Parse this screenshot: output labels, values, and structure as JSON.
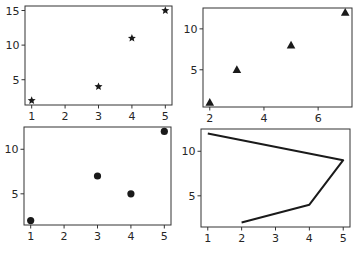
{
  "figure": {
    "layout": "2x2 subplots",
    "background": "#ffffff",
    "ink": "#1a1a1a"
  },
  "chart_data": [
    {
      "type": "scatter",
      "position": "top-left",
      "marker": "star",
      "x": [
        1,
        3,
        4,
        5
      ],
      "y": [
        2,
        4,
        11,
        15
      ],
      "title": "",
      "xlabel": "",
      "ylabel": "",
      "xticks": [
        1,
        2,
        3,
        4,
        5
      ],
      "yticks": [
        5,
        10,
        15
      ],
      "xlim": [
        0.8,
        5.2
      ],
      "ylim": [
        1.35,
        15.65
      ],
      "grid": false
    },
    {
      "type": "scatter",
      "position": "top-right",
      "marker": "triangle",
      "x": [
        2,
        3,
        5,
        7
      ],
      "y": [
        1,
        5,
        8,
        12
      ],
      "title": "",
      "xlabel": "",
      "ylabel": "",
      "xticks": [
        2,
        4,
        6
      ],
      "yticks": [
        5,
        10
      ],
      "xlim": [
        1.75,
        7.25
      ],
      "ylim": [
        0.45,
        12.55
      ],
      "grid": false
    },
    {
      "type": "scatter",
      "position": "bottom-left",
      "marker": "circle",
      "x": [
        1,
        3,
        4,
        5
      ],
      "y": [
        2,
        7,
        5,
        12
      ],
      "title": "",
      "xlabel": "",
      "ylabel": "",
      "xticks": [
        1,
        2,
        3,
        4,
        5
      ],
      "yticks": [
        5,
        10
      ],
      "xlim": [
        0.8,
        5.2
      ],
      "ylim": [
        1.5,
        12.5
      ],
      "grid": false
    },
    {
      "type": "line",
      "position": "bottom-right",
      "marker": "none",
      "x": [
        1,
        5,
        4,
        2
      ],
      "y": [
        12,
        9,
        4,
        2
      ],
      "title": "",
      "xlabel": "",
      "ylabel": "",
      "xticks": [
        1,
        2,
        3,
        4,
        5
      ],
      "yticks": [
        5,
        10
      ],
      "xlim": [
        0.8,
        5.2
      ],
      "ylim": [
        1.5,
        12.5
      ],
      "grid": false
    }
  ],
  "panels": [
    {
      "box": [
        25,
        6,
        172,
        105
      ]
    },
    {
      "box": [
        203,
        8,
        352,
        107
      ]
    },
    {
      "box": [
        24,
        127,
        171,
        225
      ]
    },
    {
      "box": [
        201,
        129,
        350,
        227
      ]
    }
  ]
}
